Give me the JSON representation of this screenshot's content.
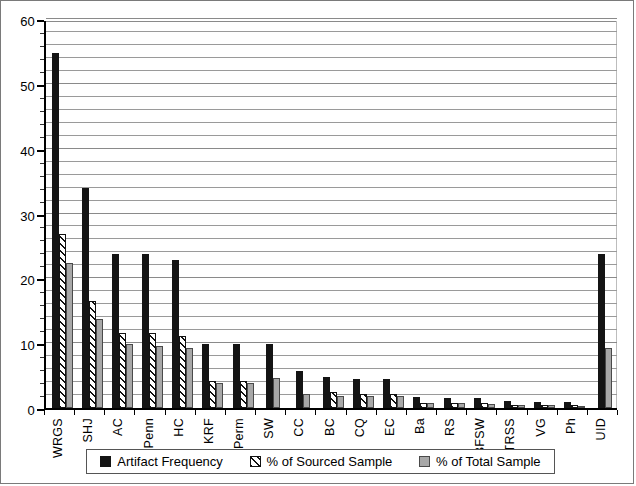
{
  "chart_data": {
    "type": "bar",
    "title": "",
    "subtitle": "",
    "xlabel": "",
    "ylabel": "",
    "ylim": [
      0,
      60
    ],
    "ytick_labels": [
      "0",
      "10",
      "20",
      "30",
      "40",
      "50",
      "60"
    ],
    "ytick_values": [
      0,
      10,
      20,
      30,
      40,
      50,
      60
    ],
    "ytick_minor_step": 2,
    "grid": "horizontal",
    "legend_position": "bottom",
    "categories": [
      "WRGS",
      "SHJ",
      "AC",
      "Penn",
      "HC",
      "KRF",
      "Perm",
      "SW",
      "CC",
      "BC",
      "CQ",
      "EC",
      "Ba",
      "RS",
      "BFSW",
      "TRSS",
      "VG",
      "Ph",
      "UID"
    ],
    "series": [
      {
        "name": "Artifact Frequency",
        "style": "solid-black",
        "color": "#141414",
        "values": [
          54.8,
          33.9,
          23.8,
          23.8,
          22.8,
          9.9,
          9.9,
          9.9,
          5.7,
          4.8,
          4.5,
          4.5,
          1.7,
          1.6,
          1.5,
          1.1,
          1.0,
          0.9,
          23.7
        ]
      },
      {
        "name": "% of Sourced Sample",
        "style": "diagonal-hatch",
        "color": "#ffffff",
        "values": [
          26.9,
          16.5,
          11.6,
          11.6,
          11.1,
          4.2,
          4.2,
          null,
          null,
          2.4,
          2.1,
          2.1,
          0.8,
          0.8,
          0.7,
          0.5,
          0.5,
          0.4,
          null
        ]
      },
      {
        "name": "% of Total Sample",
        "style": "solid-gray",
        "color": "#a8a8a8",
        "values": [
          22.3,
          13.8,
          9.8,
          9.6,
          9.2,
          3.9,
          3.9,
          4.6,
          2.2,
          1.9,
          1.8,
          1.8,
          0.7,
          0.7,
          0.6,
          0.4,
          0.4,
          0.3,
          9.2
        ]
      }
    ]
  },
  "legend": {
    "items": [
      {
        "label": "Artifact Frequency",
        "style": "s0"
      },
      {
        "label": "% of Sourced Sample",
        "style": "s1"
      },
      {
        "label": "% of Total Sample",
        "style": "s2"
      }
    ]
  }
}
